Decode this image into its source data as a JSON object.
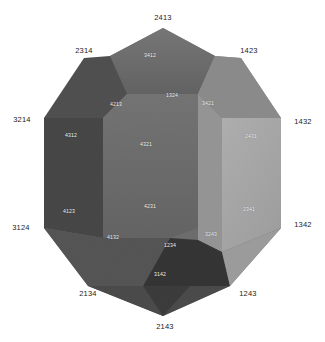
{
  "figure": {
    "kind": "permutohedron-projection",
    "background": "#ffffff",
    "width": 325,
    "height": 342
  },
  "outer_labels": [
    {
      "text": "2413",
      "x": 163,
      "y": 18
    },
    {
      "text": "2314",
      "x": 84,
      "y": 51
    },
    {
      "text": "1423",
      "x": 249,
      "y": 51
    },
    {
      "text": "3214",
      "x": 22,
      "y": 120
    },
    {
      "text": "1432",
      "x": 303,
      "y": 122
    },
    {
      "text": "3124",
      "x": 21,
      "y": 228
    },
    {
      "text": "1342",
      "x": 303,
      "y": 225
    },
    {
      "text": "2134",
      "x": 88,
      "y": 294
    },
    {
      "text": "1243",
      "x": 248,
      "y": 294
    },
    {
      "text": "2143",
      "x": 165,
      "y": 327
    }
  ],
  "inner_labels": [
    {
      "text": "3412",
      "x": 150,
      "y": 56,
      "face": "top-back"
    },
    {
      "text": "1324",
      "x": 172,
      "y": 96,
      "face": "top-center"
    },
    {
      "text": "4213",
      "x": 116,
      "y": 105,
      "face": "left-upper"
    },
    {
      "text": "3421",
      "x": 208,
      "y": 104,
      "face": "right-upper"
    },
    {
      "text": "4312",
      "x": 71,
      "y": 136,
      "face": "left-outer"
    },
    {
      "text": "2431",
      "x": 251,
      "y": 137,
      "face": "right-outer"
    },
    {
      "text": "4321",
      "x": 146,
      "y": 145,
      "face": "left-hex"
    },
    {
      "text": "4231",
      "x": 150,
      "y": 207,
      "face": "center-lower"
    },
    {
      "text": "2341",
      "x": 249,
      "y": 210,
      "face": "right-hex-lower"
    },
    {
      "text": "4123",
      "x": 69,
      "y": 212,
      "face": "left-lower"
    },
    {
      "text": "3243",
      "x": 211,
      "y": 235,
      "face": "right-lower"
    },
    {
      "text": "4132",
      "x": 113,
      "y": 238,
      "face": "left-bottom"
    },
    {
      "text": "1234",
      "x": 170,
      "y": 246,
      "face": "bottom-center"
    },
    {
      "text": "3142",
      "x": 160,
      "y": 275,
      "face": "bottom-front"
    }
  ],
  "faces": [
    {
      "name": "top-back-hex",
      "fill": "#6e6e6e",
      "points": "163,28 110,56 127,94 198,94 215,56"
    },
    {
      "name": "top-left-quad",
      "fill": "#585858",
      "points": "110,56 84,60 44,118 103,118 127,94"
    },
    {
      "name": "top-right-quad",
      "fill": "#8a8a8a",
      "points": "215,56 241,60 281,118 222,118 198,94"
    },
    {
      "name": "left-dark-face",
      "fill": "#4a4a4a",
      "points": "44,118 103,118 127,94 127,160 103,200 44,228"
    },
    {
      "name": "left-hex-face",
      "fill": "#6a6a6a",
      "points": "127,94 198,94 198,160 170,238 103,238 103,118"
    },
    {
      "name": "right-light-face",
      "fill": "#a8a8a8",
      "points": "222,118 281,118 281,228 222,252 198,240 198,94"
    },
    {
      "name": "right-mid-face",
      "fill": "#8f8f8f",
      "points": "198,94 222,118 222,252 198,240"
    },
    {
      "name": "bottom-left-face",
      "fill": "#575757",
      "points": "44,228 103,238 170,238 143,286 88,286"
    },
    {
      "name": "bottom-right-face",
      "fill": "#383838",
      "points": "170,238 198,240 222,252 230,286 174,286 143,286"
    },
    {
      "name": "bottom-front-face",
      "fill": "#4e4e4e",
      "points": "143,286 230,286 205,300 163,316 120,300"
    }
  ]
}
